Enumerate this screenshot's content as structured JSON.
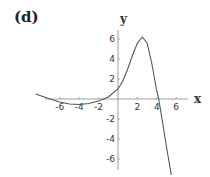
{
  "panel": {
    "label": "(d)"
  },
  "chart_data": {
    "type": "line",
    "title": "",
    "xlabel": "x",
    "ylabel": "y",
    "xlim": [
      -9,
      8
    ],
    "ylim": [
      -8,
      7.5
    ],
    "grid": false,
    "legend": null,
    "x_ticks": [
      -6,
      -4,
      -2,
      2,
      4,
      6
    ],
    "y_ticks": [
      6,
      4,
      2,
      -2,
      -4,
      -6
    ],
    "x_tick_labels": [
      "-6",
      "-4",
      "-2",
      "2",
      "4",
      "6"
    ],
    "y_tick_labels": [
      "6",
      "4",
      "2",
      "-2",
      "-4",
      "-6"
    ],
    "series": [
      {
        "name": "f(x)",
        "x": [
          -8.5,
          -7,
          -6,
          -5,
          -4,
          -3,
          -2,
          -1,
          0,
          0.5,
          1,
          1.5,
          2,
          2.5,
          3,
          3.5,
          4,
          4.2,
          4.5,
          5,
          5.5
        ],
        "y": [
          0.5,
          0.0,
          -0.3,
          -0.5,
          -0.55,
          -0.45,
          -0.2,
          0.2,
          1.0,
          1.8,
          3.0,
          4.4,
          5.6,
          6.2,
          5.6,
          3.5,
          0.8,
          0.0,
          -1.8,
          -4.8,
          -7.6
        ]
      }
    ],
    "annotations": [
      "(d)"
    ]
  }
}
